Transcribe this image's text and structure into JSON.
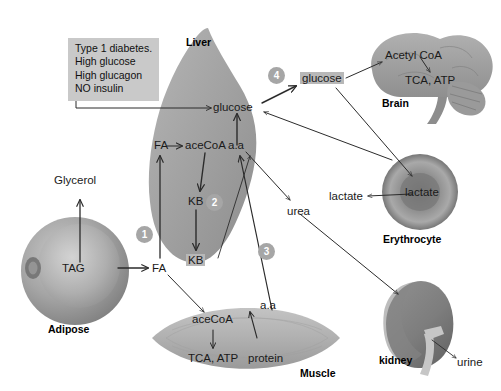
{
  "diagram": {
    "colors": {
      "organ_fill": "#9e9e9e",
      "highlight": "#b8b8b8",
      "infobox_bg": "#c9c9c9",
      "marker_bg": "#a6a6a6",
      "arrow": "#2b2b2b"
    }
  },
  "infobox": {
    "line1": "Type 1 diabetes.",
    "line2": "High glucose",
    "line3": "High glucagon",
    "line4": "NO insulin"
  },
  "organs": {
    "liver": "Liver",
    "adipose": "Adipose",
    "brain": "Brain",
    "erythrocyte": "Erythrocyte",
    "kidney": "kidney",
    "muscle": "Muscle"
  },
  "liver": {
    "glucose": "glucose",
    "fa": "FA",
    "acecoa": "aceCoA",
    "aa": "a.a",
    "kb_inner": "KB",
    "kb_out": "KB"
  },
  "adipose": {
    "tag": "TAG",
    "glycerol": "Glycerol",
    "fa": "FA"
  },
  "brain": {
    "acetyl_coa": "Acetyl CoA",
    "tca_atp": "TCA, ATP"
  },
  "muscle": {
    "acecoa": "aceCoA",
    "tca_atp": "TCA, ATP",
    "aa": "a.a",
    "protein": "protein"
  },
  "erythrocyte": {
    "lactate_in": "lactate",
    "lactate_out": "lactate"
  },
  "kidney": {
    "urine": "urine"
  },
  "blood": {
    "glucose": "glucose",
    "urea": "urea"
  },
  "markers": {
    "one": "1",
    "two": "2",
    "three": "3",
    "four": "4"
  }
}
